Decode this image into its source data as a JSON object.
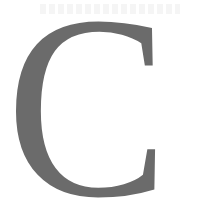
{
  "drop_cap": {
    "letter": "C",
    "color": "#6b6b6b",
    "background": "#ffffff"
  }
}
